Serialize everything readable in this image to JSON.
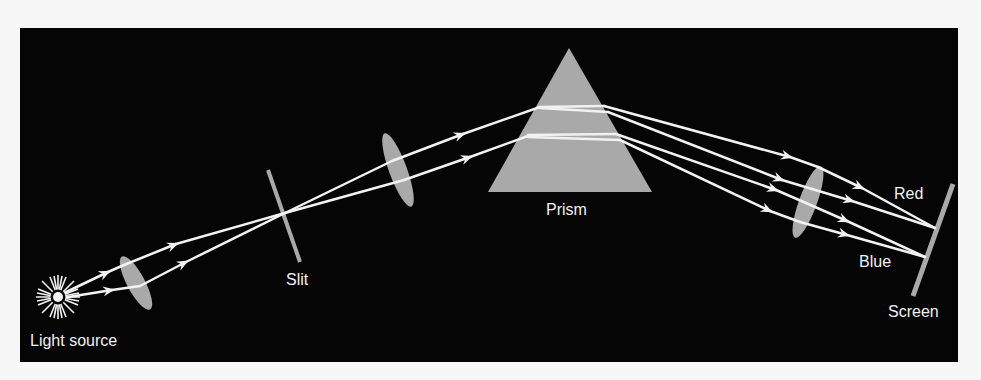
{
  "diagram": {
    "colors": {
      "page_background": "#f7f7f7",
      "panel_background": "#050505",
      "optic_fill": "#a9a9a9",
      "ray_color": "#f2f2f2",
      "label_color": "#f2f2f2"
    },
    "labels": {
      "light_source": "Light source",
      "slit": "Slit",
      "prism": "Prism",
      "red": "Red",
      "blue": "Blue",
      "screen": "Screen"
    },
    "components": [
      {
        "id": "light-source",
        "label": "Light source"
      },
      {
        "id": "collimating-lens-1",
        "label": ""
      },
      {
        "id": "slit",
        "label": "Slit"
      },
      {
        "id": "collimating-lens-2",
        "label": ""
      },
      {
        "id": "prism",
        "label": "Prism"
      },
      {
        "id": "focusing-lens",
        "label": ""
      },
      {
        "id": "screen",
        "label": "Screen"
      }
    ],
    "spectrum_labels": [
      "Red",
      "Blue"
    ]
  }
}
